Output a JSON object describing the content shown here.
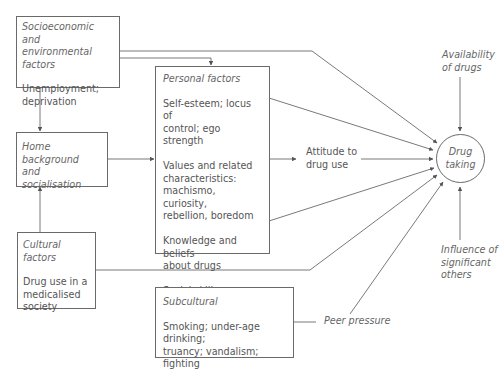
{
  "diagram": {
    "nodes": {
      "socioeconomic": {
        "title": "Socioeconomic and environmental factors",
        "title_line1": "Socioeconomic and",
        "title_line2": "environmental factors",
        "body_line1": "Unemployment;",
        "body_line2": "deprivation"
      },
      "home": {
        "title_line1": "Home background",
        "title_line2": "and",
        "title_line3": "socialisation"
      },
      "cultural": {
        "title": "Cultural factors",
        "body_line1": "Drug use in a",
        "body_line2": "medicalised",
        "body_line3": "society"
      },
      "personal": {
        "title": "Personal factors",
        "items": [
          {
            "line1": "Self-esteem; locus of",
            "line2": "control; ego strength"
          },
          {
            "line1": "Values and related",
            "line2": "characteristics:",
            "line3": "machismo, curiosity,",
            "line4": "rebellion, boredom"
          },
          {
            "line1": "Knowledge and beliefs",
            "line2": "about drugs"
          },
          {
            "line1": "Social skills"
          }
        ]
      },
      "subcultural": {
        "title": "Subcultural",
        "body_line1": "Smoking; under-age drinking;",
        "body_line2": "truancy; vandalism; fighting"
      },
      "attitude": {
        "line1": "Attitude to",
        "line2": "drug use"
      },
      "drug_taking": {
        "line1": "Drug",
        "line2": "taking"
      },
      "availability": {
        "line1": "Availability",
        "line2": "of drugs"
      },
      "influence": {
        "line1": "Influence of",
        "line2": "significant",
        "line3": "others"
      },
      "peer_pressure": {
        "label": "Peer pressure"
      }
    },
    "edges": [
      {
        "from": "socioeconomic",
        "to": "drug_taking"
      },
      {
        "from": "socioeconomic",
        "to": "personal"
      },
      {
        "from": "socioeconomic",
        "to": "home"
      },
      {
        "from": "cultural",
        "to": "home"
      },
      {
        "from": "home",
        "to": "personal"
      },
      {
        "from": "personal",
        "to": "attitude"
      },
      {
        "from": "attitude",
        "to": "drug_taking"
      },
      {
        "from": "personal",
        "to": "drug_taking"
      },
      {
        "from": "personal",
        "to": "drug_taking"
      },
      {
        "from": "cultural",
        "to": "drug_taking"
      },
      {
        "from": "subcultural",
        "to": "peer_pressure"
      },
      {
        "from": "peer_pressure",
        "to": "drug_taking"
      },
      {
        "from": "availability",
        "to": "drug_taking"
      },
      {
        "from": "influence",
        "to": "drug_taking"
      }
    ],
    "colors": {
      "line": "#5a5a5a",
      "text": "#555555",
      "background": "#ffffff"
    }
  }
}
